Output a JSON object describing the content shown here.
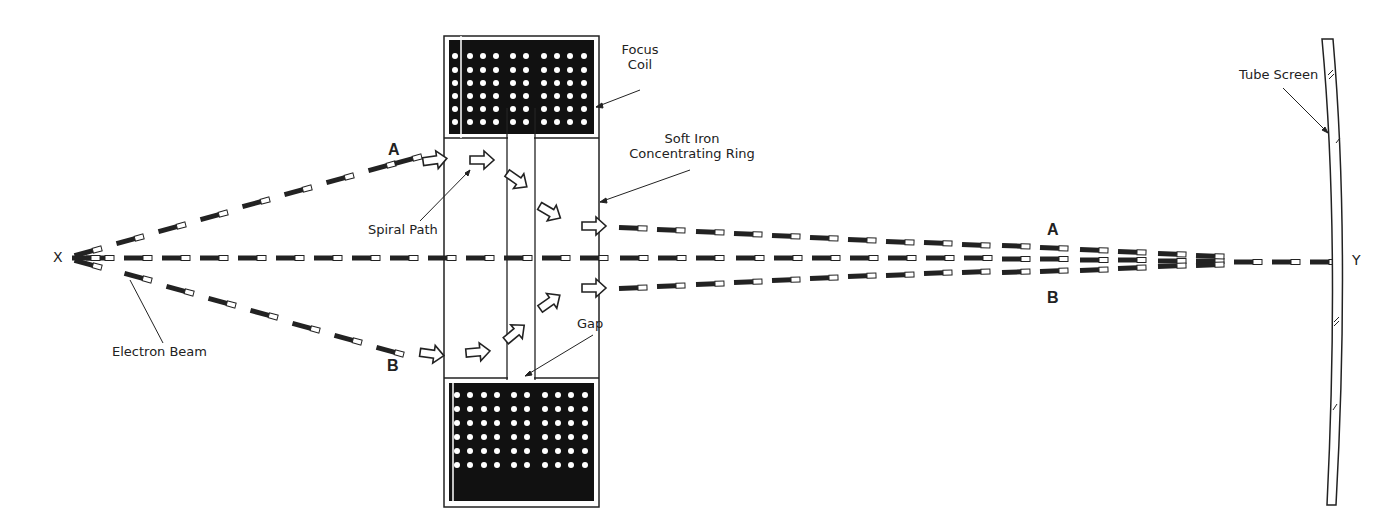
{
  "diagram": {
    "labels": {
      "focus_coil": "Focus\nCoil",
      "focus_coil_line1": "Focus",
      "focus_coil_line2": "Coil",
      "soft_iron_line1": "Soft Iron",
      "soft_iron_line2": "Concentrating Ring",
      "spiral_path": "Spiral Path",
      "gap": "Gap",
      "electron_beam": "Electron Beam",
      "tube_screen": "Tube Screen",
      "point_x": "X",
      "point_y": "Y",
      "path_a_left": "A",
      "path_b_left": "B",
      "path_a_right": "A",
      "path_b_right": "B"
    },
    "colors": {
      "ink": "#222222",
      "coil_fill": "#111111",
      "coil_dots": "#ffffff",
      "background": "#ffffff"
    },
    "coil": {
      "rows": 6,
      "cols": 10
    }
  }
}
